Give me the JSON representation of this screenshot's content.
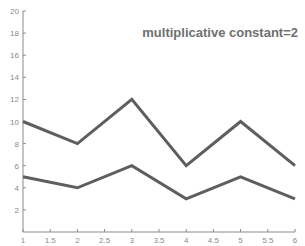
{
  "chart_data": {
    "type": "line",
    "title": "multiplicative constant=2",
    "xlabel": "",
    "ylabel": "",
    "xlim": [
      1,
      6
    ],
    "ylim": [
      0,
      20
    ],
    "xticks": [
      1,
      1.5,
      2,
      2.5,
      3,
      3.5,
      4,
      4.5,
      5,
      5.5,
      6
    ],
    "xtick_labels": [
      "1",
      "1.5",
      "2",
      "2.5",
      "3",
      "3.5",
      "4",
      "4.5",
      "5",
      "5.5",
      "6"
    ],
    "yticks": [
      2,
      4,
      6,
      8,
      10,
      12,
      14,
      16,
      18,
      20
    ],
    "ytick_labels": [
      "2",
      "4",
      "6",
      "8",
      "10",
      "12",
      "14",
      "16",
      "18",
      "20"
    ],
    "grid": false,
    "x": [
      1,
      2,
      3,
      4,
      5,
      6
    ],
    "series": [
      {
        "name": "scaled",
        "values": [
          10,
          8,
          12,
          6,
          10,
          6
        ],
        "color": "#5e5e5e"
      },
      {
        "name": "original",
        "values": [
          5,
          4,
          6,
          3,
          5,
          3
        ],
        "color": "#5e5e5e"
      }
    ]
  }
}
